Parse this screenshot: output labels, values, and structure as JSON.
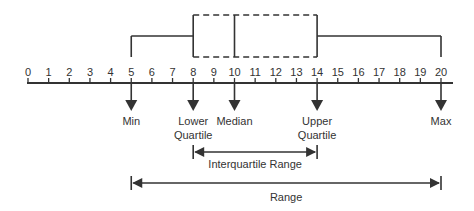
{
  "diagram": {
    "type": "box-plot-explanation",
    "axis": {
      "min": 0,
      "max": 20,
      "ticks": [
        "0",
        "1",
        "2",
        "3",
        "4",
        "5",
        "6",
        "7",
        "8",
        "9",
        "10",
        "11",
        "12",
        "13",
        "14",
        "15",
        "16",
        "17",
        "18",
        "19",
        "20"
      ]
    },
    "box_plot": {
      "min": 5,
      "lower_quartile": 8,
      "median": 10,
      "upper_quartile": 14,
      "max": 20
    },
    "markers": [
      {
        "id": "min",
        "value": 5,
        "label_lines": [
          "Min"
        ]
      },
      {
        "id": "lower-quartile",
        "value": 8,
        "label_lines": [
          "Lower",
          "Quartile"
        ]
      },
      {
        "id": "median",
        "value": 10,
        "label_lines": [
          "Median"
        ]
      },
      {
        "id": "upper-quartile",
        "value": 14,
        "label_lines": [
          "Upper",
          "Quartile"
        ]
      },
      {
        "id": "max",
        "value": 20,
        "label_lines": [
          "Max"
        ]
      }
    ],
    "spans": [
      {
        "id": "interquartile-range",
        "from": 8,
        "to": 14,
        "label": "Interquartile Range"
      },
      {
        "id": "range",
        "from": 5,
        "to": 20,
        "label": "Range"
      }
    ],
    "colors": {
      "line": "#333333",
      "text": "#333333",
      "background": "#ffffff"
    }
  }
}
